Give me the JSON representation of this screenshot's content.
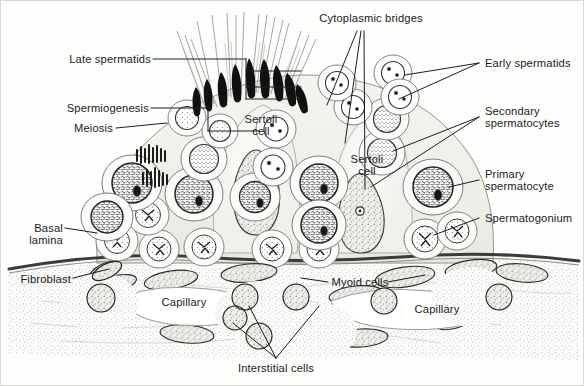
{
  "figure": {
    "background_color": "#fdfdfc",
    "ink_color": "#1b1b1b",
    "width": 584,
    "height": 386
  },
  "labels": {
    "cytoplasmic_bridges": "Cytoplasmic bridges",
    "late_spermatids": "Late spermatids",
    "spermiogenesis": "Spermiogenesis",
    "meiosis": "Meiosis",
    "early_spermatids": "Early spermatids",
    "secondary_spermatocytes_l1": "Secondary",
    "secondary_spermatocytes_l2": "spermatocytes",
    "primary_spermatocyte_l1": "Primary",
    "primary_spermatocyte_l2": "spermatocyte",
    "spermatogonium": "Spermatogonium",
    "sertoli_cell_1_l1": "Sertoli",
    "sertoli_cell_1_l2": "cell",
    "sertoli_cell_2_l1": "Sertoli",
    "sertoli_cell_2_l2": "cell",
    "basal_lamina_l1": "Basal",
    "basal_lamina_l2": "lamina",
    "fibroblast": "Fibroblast",
    "myoid_cells": "Myoid cells",
    "capillary_left": "Capillary",
    "capillary_right": "Capillary",
    "interstitial_cells": "Interstitial cells"
  },
  "structures": {
    "sperm_tails_count": 16,
    "sperm_heads_count": 9,
    "germ_cell_layers": [
      "spermatogonia",
      "primary spermatocytes",
      "secondary spermatocytes",
      "early spermatids",
      "late spermatids"
    ],
    "interstitial_capillaries": 2
  }
}
